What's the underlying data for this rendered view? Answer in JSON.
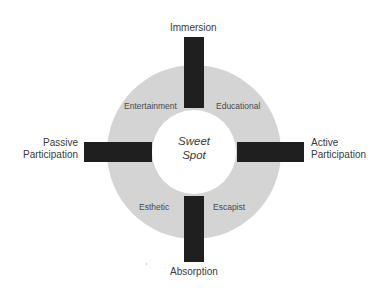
{
  "diagram": {
    "center": {
      "line1": "Sweet",
      "line2": "Spot"
    },
    "axes": {
      "top": "Immersion",
      "bottom": "Absorption",
      "left_line1": "Passive",
      "left_line2": "Participation",
      "right_line1": "Active",
      "right_line2": "Participation"
    },
    "quadrants": {
      "top_left": "Entertainment",
      "top_right": "Educational",
      "bottom_left": "Esthetic",
      "bottom_right": "Escapist"
    },
    "colors": {
      "ring": "#d4d4d4",
      "bars": "#1f1f1f",
      "center": "#ffffff",
      "text": "#3a3a3a"
    }
  }
}
